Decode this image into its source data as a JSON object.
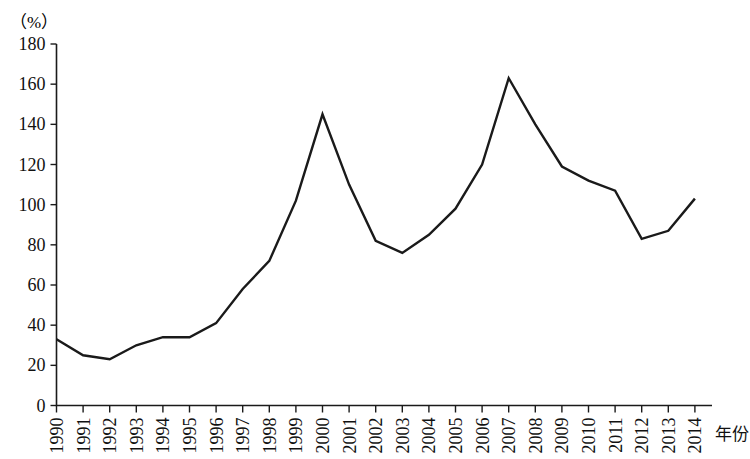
{
  "chart_data": {
    "type": "line",
    "title": "",
    "subtitle": "",
    "unit_label": "（%）",
    "xlabel": "年份",
    "ylabel": "",
    "xlim": [
      1990,
      2014
    ],
    "ylim": [
      0,
      180
    ],
    "grid": false,
    "legend": "none",
    "y_ticks": [
      0,
      20,
      40,
      60,
      80,
      100,
      120,
      140,
      160,
      180
    ],
    "y_tick_labels": [
      "0",
      "20",
      "40",
      "60",
      "80",
      "100",
      "120",
      "140",
      "160",
      "180"
    ],
    "categories": [
      "1990",
      "1991",
      "1992",
      "1993",
      "1994",
      "1995",
      "1996",
      "1997",
      "1998",
      "1999",
      "2000",
      "2001",
      "2002",
      "2003",
      "2004",
      "2005",
      "2006",
      "2007",
      "2008",
      "2009",
      "2010",
      "2011",
      "2012",
      "2013",
      "2014"
    ],
    "values": [
      33,
      25,
      23,
      30,
      34,
      34,
      41,
      58,
      72,
      102,
      145,
      110,
      82,
      76,
      85,
      98,
      120,
      163,
      140,
      119,
      112,
      107,
      83,
      87,
      103
    ],
    "series": [
      {
        "name": "",
        "values": [
          33,
          25,
          23,
          30,
          34,
          34,
          41,
          58,
          72,
          102,
          145,
          110,
          82,
          76,
          85,
          98,
          120,
          163,
          140,
          119,
          112,
          107,
          83,
          87,
          103
        ]
      }
    ],
    "line_color": "#1a1a1a"
  }
}
